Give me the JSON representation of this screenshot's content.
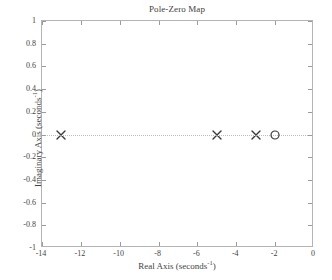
{
  "chart_data": {
    "type": "scatter",
    "title": "Pole-Zero Map",
    "xlabel": "Real Axis (seconds",
    "xlabel_sup": "-1",
    "xlabel_tail": ")",
    "ylabel": "Imaginary Axis (seconds",
    "ylabel_sup": "-1",
    "ylabel_tail": ")",
    "xlim": [
      -14,
      0
    ],
    "ylim": [
      -1,
      1
    ],
    "grid": false,
    "zero_line": true,
    "legend": null,
    "xticks": [
      -14,
      -12,
      -10,
      -8,
      -6,
      -4,
      -2,
      0
    ],
    "xticklabels": [
      "-14",
      "-12",
      "-10",
      "-8",
      "-6",
      "-4",
      "-2",
      "0"
    ],
    "yticks": [
      1,
      0.8,
      0.6,
      0.4,
      0.2,
      0,
      -0.2,
      -0.4,
      -0.6,
      -0.8,
      -1
    ],
    "yticklabels": [
      "1",
      "0.8",
      "0.6",
      "0.4",
      "0.2",
      "0",
      "-0.2",
      "-0.4",
      "-0.6",
      "-0.8",
      "-1"
    ],
    "series": [
      {
        "name": "poles",
        "marker": "x",
        "color": "#3a3a3a",
        "points": [
          {
            "x": -13,
            "y": 0
          },
          {
            "x": -5,
            "y": 0
          },
          {
            "x": -3,
            "y": 0
          }
        ]
      },
      {
        "name": "zeros",
        "marker": "o",
        "color": "#3a3a3a",
        "points": [
          {
            "x": -2,
            "y": 0
          }
        ]
      }
    ]
  },
  "colors": {
    "axis": "#b4b4b4",
    "tick": "#9a9a9a",
    "text": "#3f3f3f",
    "marker": "#3a3a3a",
    "zero_line": "#bdbdbd",
    "background": "#ffffff"
  }
}
